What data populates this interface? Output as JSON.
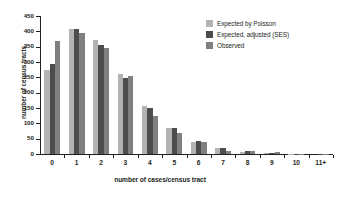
{
  "chart_data": {
    "type": "bar",
    "title": "",
    "xlabel": "number of cases/census tract",
    "ylabel": "number of census tracts",
    "categories": [
      "0",
      "1",
      "2",
      "3",
      "4",
      "5",
      "6",
      "7",
      "8",
      "9",
      "10",
      "11+"
    ],
    "series": [
      {
        "name": "Expected by Poisson",
        "color": "#b3b3b3",
        "values": [
          275,
          408,
          371,
          262,
          155,
          84,
          40,
          20,
          7,
          3,
          1,
          0
        ]
      },
      {
        "name": "Expected, adjusted (SES)",
        "color": "#4d4d4d",
        "values": [
          295,
          408,
          357,
          247,
          149,
          84,
          43,
          20,
          9,
          3,
          1,
          1
        ]
      },
      {
        "name": "Observed",
        "color": "#808080",
        "values": [
          367,
          393,
          346,
          256,
          124,
          67,
          40,
          11,
          11,
          5,
          1,
          1
        ]
      }
    ],
    "ylim": [
      0,
      450
    ],
    "yticks": [
      0,
      50,
      100,
      150,
      200,
      250,
      300,
      350,
      400,
      450
    ],
    "grid": false,
    "legend_position": "top-right"
  }
}
